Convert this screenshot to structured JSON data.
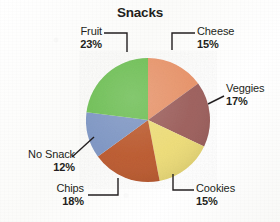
{
  "chart_data": {
    "type": "pie",
    "title": "Snacks",
    "xlabel": "",
    "ylabel": "",
    "grid": false,
    "legend": "none",
    "value_suffix": "%",
    "start_angle_deg": 0,
    "direction": "clockwise",
    "categories": [
      "Cheese",
      "Veggies",
      "Cookies",
      "Chips",
      "No Snack",
      "Fruit"
    ],
    "values": [
      15,
      17,
      15,
      18,
      12,
      23
    ],
    "slices": [
      {
        "label": "Cheese",
        "value": 15,
        "value_text": "15%",
        "color": "#e8946a",
        "angle_deg": 54.0
      },
      {
        "label": "Veggies",
        "value": 17,
        "value_text": "17%",
        "color": "#9d5f5c",
        "angle_deg": 61.2
      },
      {
        "label": "Cookies",
        "value": 15,
        "value_text": "15%",
        "color": "#eedd78",
        "angle_deg": 54.0
      },
      {
        "label": "Chips",
        "value": 18,
        "value_text": "18%",
        "color": "#bc5a2e",
        "angle_deg": 64.8
      },
      {
        "label": "No Snack",
        "value": 12,
        "value_text": "12%",
        "color": "#7e96c4",
        "angle_deg": 43.2
      },
      {
        "label": "Fruit",
        "value": 23,
        "value_text": "23%",
        "color": "#6dbf53",
        "angle_deg": 82.8
      }
    ]
  },
  "chart": {
    "title": "Snacks",
    "labels": {
      "cheese": {
        "name": "Cheese",
        "percent": "15%"
      },
      "veggies": {
        "name": "Veggies",
        "percent": "17%"
      },
      "cookies": {
        "name": "Cookies",
        "percent": "15%"
      },
      "chips": {
        "name": "Chips",
        "percent": "18%"
      },
      "no_snack": {
        "name": "No Snack",
        "percent": "12%"
      },
      "fruit": {
        "name": "Fruit",
        "percent": "23%"
      }
    },
    "colors": {
      "cheese": "#e8946a",
      "veggies": "#9d5f5c",
      "cookies": "#eedd78",
      "chips": "#bc5a2e",
      "no_snack": "#7e96c4",
      "fruit": "#6dbf53",
      "leader_line": "#231f20",
      "text": "#231f20",
      "background": "#fdfdfc"
    }
  }
}
